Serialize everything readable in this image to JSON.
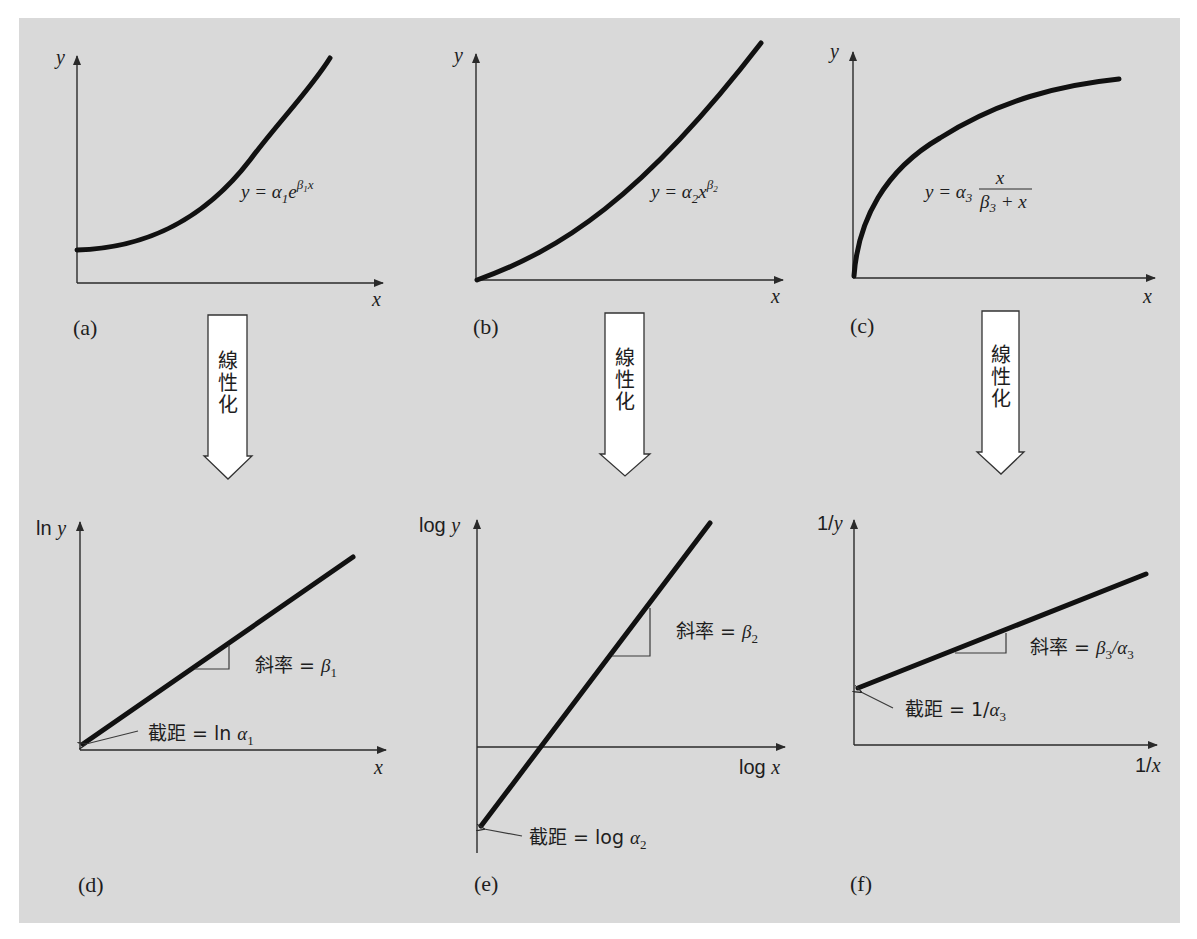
{
  "figure": {
    "background_color": "#d9d9d9",
    "line_color": "#111111",
    "arrow_fill": "#ffffff",
    "linearize_label": [
      "線",
      "性",
      "化"
    ]
  },
  "panels": {
    "a": {
      "label": "(a)",
      "y_axis": "y",
      "x_axis": "x",
      "equation": {
        "lhs": "y = α",
        "sub1": "1",
        "base": "e",
        "sup": "β",
        "sup_sub": "1",
        "sup_tail": "x"
      }
    },
    "b": {
      "label": "(b)",
      "y_axis": "y",
      "x_axis": "x",
      "equation": {
        "lhs": "y = α",
        "sub1": "2",
        "base": "x",
        "sup": "β",
        "sup_sub": "2"
      }
    },
    "c": {
      "label": "(c)",
      "y_axis": "y",
      "x_axis": "x",
      "equation": {
        "lhs": "y = α",
        "sub1": "3",
        "numerator": "x",
        "den_beta": "β",
        "den_sub": "3",
        "den_tail": " + x"
      }
    },
    "d": {
      "label": "(d)",
      "y_axis_prefix": "ln ",
      "y_axis_var": "y",
      "x_axis": "x",
      "slope": {
        "text": "斜率 = ",
        "sym": "β",
        "sub": "1"
      },
      "intercept": {
        "text": "截距 = ln ",
        "sym": "α",
        "sub": "1"
      }
    },
    "e": {
      "label": "(e)",
      "y_axis_prefix": "log ",
      "y_axis_var": "y",
      "x_axis_prefix": "log ",
      "x_axis_var": "x",
      "slope": {
        "text": "斜率 = ",
        "sym": "β",
        "sub": "2"
      },
      "intercept": {
        "text": "截距 = log ",
        "sym": "α",
        "sub": "2"
      }
    },
    "f": {
      "label": "(f)",
      "y_axis_prefix": "1/",
      "y_axis_var": "y",
      "x_axis_prefix": "1/",
      "x_axis_var": "x",
      "slope": {
        "text": "斜率 = ",
        "sym": "β",
        "sub": "3",
        "mid": "/α",
        "sub2": "3"
      },
      "intercept": {
        "text": "截距 = 1/",
        "sym": "α",
        "sub": "3"
      }
    }
  }
}
